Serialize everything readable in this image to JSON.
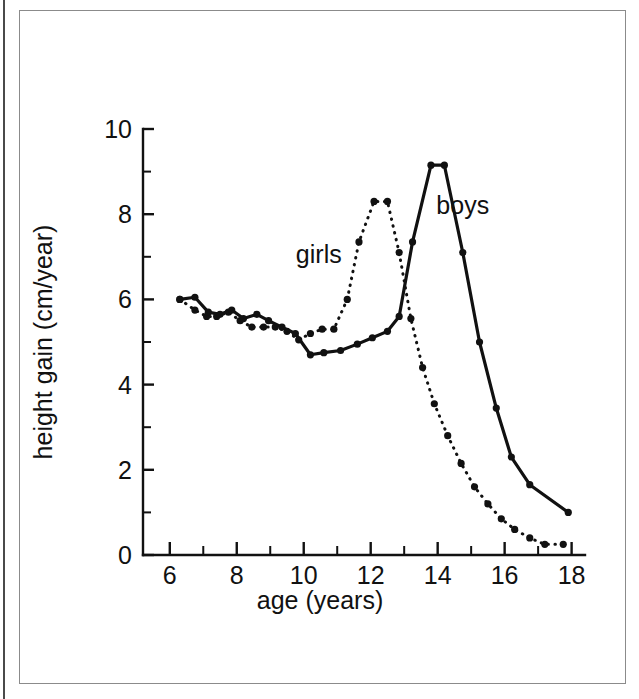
{
  "figure": {
    "background_color": "#ffffff",
    "ink_color": "#111111",
    "frame_color": "#8b8b8b"
  },
  "chart_data": {
    "type": "line",
    "title": "",
    "subtitle": "",
    "xlabel": "age (years)",
    "ylabel": "height gain (cm/year)",
    "xlim": [
      5.2,
      18.4
    ],
    "ylim": [
      0,
      10
    ],
    "xticks": [
      6,
      8,
      10,
      12,
      14,
      16,
      18
    ],
    "xtick_labels": [
      "6",
      "8",
      "10",
      "12",
      "14",
      "16",
      "18"
    ],
    "xticks_minor": [
      7,
      9,
      11,
      13,
      15,
      17
    ],
    "yticks": [
      0,
      2,
      4,
      6,
      8,
      10
    ],
    "ytick_labels": [
      "0",
      "2",
      "4",
      "6",
      "8",
      "10"
    ],
    "yticks_minor": [
      1,
      3,
      5,
      7,
      9
    ],
    "grid": false,
    "legend": "inline-annotations",
    "annotations": [
      {
        "text": "girls",
        "x": 10.45,
        "y": 6.85
      },
      {
        "text": "boys",
        "x": 14.75,
        "y": 8.0
      }
    ],
    "series": [
      {
        "name": "girls",
        "style": "dotted",
        "marker": "circle",
        "x": [
          6.3,
          6.75,
          7.1,
          7.4,
          7.75,
          8.1,
          8.45,
          8.8,
          9.15,
          9.5,
          9.85,
          10.2,
          10.55,
          10.9,
          11.3,
          11.65,
          12.1,
          12.5,
          12.85,
          13.2,
          13.55,
          13.9,
          14.3,
          14.7,
          15.1,
          15.5,
          15.9,
          16.3,
          16.75,
          17.2,
          17.75
        ],
        "y": [
          6.0,
          5.75,
          5.6,
          5.6,
          5.7,
          5.5,
          5.35,
          5.35,
          5.35,
          5.25,
          5.05,
          5.2,
          5.3,
          5.3,
          6.0,
          7.35,
          8.3,
          8.3,
          7.1,
          5.55,
          4.4,
          3.55,
          2.8,
          2.15,
          1.6,
          1.2,
          0.85,
          0.6,
          0.4,
          0.25,
          0.25
        ]
      },
      {
        "name": "boys",
        "style": "solid",
        "marker": "circle",
        "x": [
          6.3,
          6.75,
          7.15,
          7.5,
          7.85,
          8.2,
          8.6,
          8.95,
          9.35,
          9.75,
          10.2,
          10.6,
          11.1,
          11.6,
          12.05,
          12.5,
          12.85,
          13.25,
          13.8,
          14.2,
          14.75,
          15.25,
          15.75,
          16.2,
          16.75,
          17.9
        ],
        "y": [
          6.0,
          6.05,
          5.7,
          5.65,
          5.75,
          5.55,
          5.65,
          5.5,
          5.35,
          5.2,
          4.7,
          4.75,
          4.8,
          4.95,
          5.1,
          5.25,
          5.6,
          7.35,
          9.15,
          9.15,
          7.1,
          5.0,
          3.45,
          2.3,
          1.65,
          1.0
        ]
      }
    ]
  }
}
